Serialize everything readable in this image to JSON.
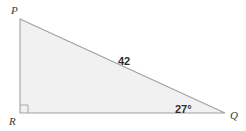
{
  "figure": {
    "type": "right-triangle-diagram",
    "background_color": "#ffffff",
    "fill_color": "#f1f1f1",
    "stroke_color": "#a0a0a0",
    "label_color": "#3a3a3a",
    "measure_color": "#2f2f2f",
    "vertices": {
      "P": {
        "label": "P",
        "x": 20,
        "y": 19
      },
      "R": {
        "label": "R",
        "x": 20,
        "y": 113
      },
      "Q": {
        "label": "Q",
        "x": 225,
        "y": 113
      }
    },
    "right_angle": {
      "at_vertex": "R",
      "marker": "square",
      "size": 8
    },
    "measures": {
      "hypotenuse_label": "42",
      "hypotenuse_side": "PQ",
      "angle_label": "27°",
      "angle_at_vertex": "Q"
    },
    "polygon_points": "20,19 225,113 20,113"
  }
}
